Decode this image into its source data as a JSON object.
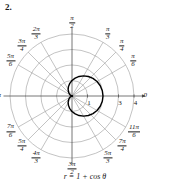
{
  "problem": {
    "number": "2."
  },
  "caption": {
    "equation": "r = 1 + cos θ"
  },
  "chart_data": {
    "type": "line",
    "subtype": "polar",
    "title": "",
    "equation": "r = 1 + cos θ",
    "curve_name": "cardioid",
    "polar_center": {
      "x": 72,
      "y": 82
    },
    "pixels_per_unit": 15.5,
    "radial_axis": {
      "label": "r",
      "rmin": 0,
      "rmax": 4,
      "grid_circles": [
        1,
        2,
        3,
        4
      ],
      "tick_labels": [
        "1",
        "3",
        "4"
      ],
      "tick_values": [
        1,
        3,
        4
      ]
    },
    "angular_axis": {
      "label": "θ",
      "grid": true,
      "spoke_angles_deg": [
        0,
        30,
        45,
        60,
        90,
        120,
        135,
        150,
        180,
        210,
        225,
        240,
        270,
        300,
        315,
        330
      ]
    },
    "angle_labels": [
      {
        "name": "zero",
        "text_num": "0",
        "text_den": "",
        "angle_deg": 0,
        "r": 4.72,
        "plain": true
      },
      {
        "name": "pi-over-6",
        "text_num": "π",
        "text_den": "6",
        "angle_deg": 30,
        "r": 4.55,
        "plain": false
      },
      {
        "name": "pi-over-4",
        "text_num": "π",
        "text_den": "4",
        "angle_deg": 45,
        "r": 4.55,
        "plain": false
      },
      {
        "name": "pi-over-3",
        "text_num": "π",
        "text_den": "3",
        "angle_deg": 60,
        "r": 4.62,
        "plain": false
      },
      {
        "name": "pi-over-2",
        "text_num": "π",
        "text_den": "2",
        "angle_deg": 90,
        "r": 4.7,
        "plain": false
      },
      {
        "name": "two-pi-over-3",
        "text_num": "2π",
        "text_den": "3",
        "angle_deg": 120,
        "r": 4.62,
        "plain": false
      },
      {
        "name": "three-pi-over-4",
        "text_num": "3π",
        "text_den": "4",
        "angle_deg": 135,
        "r": 4.58,
        "plain": false
      },
      {
        "name": "five-pi-over-6",
        "text_num": "5π",
        "text_den": "6",
        "angle_deg": 150,
        "r": 4.58,
        "plain": false
      },
      {
        "name": "pi",
        "text_num": "π",
        "text_den": "",
        "angle_deg": 180,
        "r": 4.7,
        "plain": true
      },
      {
        "name": "seven-pi-over-6",
        "text_num": "7π",
        "text_den": "6",
        "angle_deg": 210,
        "r": 4.58,
        "plain": false
      },
      {
        "name": "five-pi-over-4",
        "text_num": "5π",
        "text_den": "4",
        "angle_deg": 225,
        "r": 4.58,
        "plain": false
      },
      {
        "name": "four-pi-over-3",
        "text_num": "4π",
        "text_den": "3",
        "angle_deg": 240,
        "r": 4.62,
        "plain": false
      },
      {
        "name": "three-pi-over-2",
        "text_num": "3π",
        "text_den": "2",
        "angle_deg": 270,
        "r": 4.7,
        "plain": false
      },
      {
        "name": "five-pi-over-3",
        "text_num": "5π",
        "text_den": "3",
        "angle_deg": 300,
        "r": 4.62,
        "plain": false
      },
      {
        "name": "seven-pi-over-4",
        "text_num": "7π",
        "text_den": "4",
        "angle_deg": 315,
        "r": 4.58,
        "plain": false
      },
      {
        "name": "eleven-pi-over-6",
        "text_num": "11π",
        "text_den": "6",
        "angle_deg": 330,
        "r": 4.62,
        "plain": false
      }
    ],
    "series": [
      {
        "name": "r = 1 + cos θ",
        "color": "#000000",
        "line_width": 1.4,
        "theta_deg": [
          0,
          10,
          20,
          30,
          40,
          50,
          60,
          70,
          80,
          90,
          100,
          110,
          120,
          130,
          140,
          150,
          160,
          170,
          180,
          190,
          200,
          210,
          220,
          230,
          240,
          250,
          260,
          270,
          280,
          290,
          300,
          310,
          320,
          330,
          340,
          350,
          360
        ],
        "r": [
          2.0,
          1.985,
          1.94,
          1.866,
          1.766,
          1.643,
          1.5,
          1.342,
          1.174,
          1.0,
          0.826,
          0.658,
          0.5,
          0.357,
          0.234,
          0.134,
          0.06,
          0.015,
          0.0,
          0.015,
          0.06,
          0.134,
          0.234,
          0.357,
          0.5,
          0.658,
          0.826,
          1.0,
          1.174,
          1.342,
          1.5,
          1.643,
          1.766,
          1.866,
          1.94,
          1.985,
          2.0
        ]
      }
    ],
    "colors": {
      "grid": "#9a9a9a",
      "axis": "#4a4a4a",
      "curve": "#000000",
      "text": "#1a1a1a",
      "background": "#ffffff"
    }
  }
}
